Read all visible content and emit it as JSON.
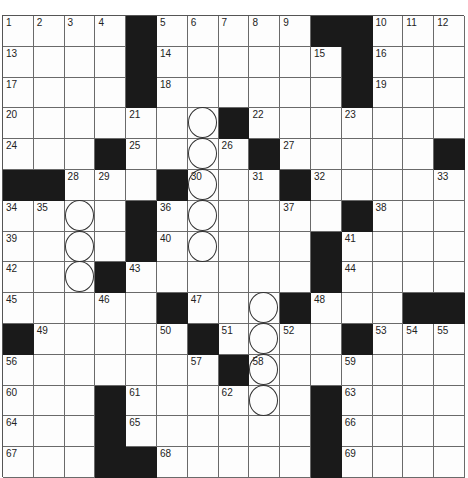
{
  "puzzle": {
    "rows": 15,
    "cols": 15,
    "layout": [
      "1111011111001 11",
      "placeholder"
    ],
    "grid": [
      [
        {
          "n": "1"
        },
        {
          "n": "2"
        },
        {
          "n": "3"
        },
        {
          "n": "4"
        },
        {
          "b": 1
        },
        {
          "n": "5"
        },
        {
          "n": "6"
        },
        {
          "n": "7"
        },
        {
          "n": "8"
        },
        {
          "n": "9"
        },
        {
          "b": 1
        },
        {
          "b": 1
        },
        {
          "n": "10"
        },
        {
          "n": "11"
        },
        {
          "n": "12"
        }
      ],
      [
        {
          "n": "13"
        },
        {},
        {},
        {},
        {
          "b": 1
        },
        {
          "n": "14"
        },
        {},
        {},
        {},
        {},
        {
          "n": "15"
        },
        {
          "b": 1
        },
        {
          "n": "16"
        },
        {},
        {}
      ],
      [
        {
          "n": "17"
        },
        {},
        {},
        {},
        {
          "b": 1
        },
        {
          "n": "18"
        },
        {},
        {},
        {},
        {},
        {},
        {
          "b": 1
        },
        {
          "n": "19"
        },
        {},
        {}
      ],
      [
        {
          "n": "20"
        },
        {},
        {},
        {},
        {
          "n": "21"
        },
        {},
        {
          "c": 1
        },
        {
          "b": 1
        },
        {
          "n": "22"
        },
        {},
        {},
        {
          "n": "23"
        },
        {},
        {},
        {}
      ],
      [
        {
          "n": "24"
        },
        {},
        {},
        {
          "b": 1
        },
        {
          "n": "25"
        },
        {},
        {
          "c": 1
        },
        {
          "n": "26"
        },
        {
          "b": 1
        },
        {
          "n": "27"
        },
        {},
        {},
        {},
        {},
        {
          "b": 1
        }
      ],
      [
        {
          "b": 1
        },
        {
          "b": 1
        },
        {
          "n": "28"
        },
        {
          "n": "29"
        },
        {},
        {
          "b": 1
        },
        {
          "n": "30",
          "c": 1
        },
        {},
        {
          "n": "31"
        },
        {
          "b": 1
        },
        {
          "n": "32"
        },
        {},
        {},
        {},
        {
          "n": "33"
        }
      ],
      [
        {
          "n": "34"
        },
        {
          "n": "35"
        },
        {
          "c": 1
        },
        {},
        {
          "b": 1
        },
        {
          "n": "36"
        },
        {
          "c": 1
        },
        {},
        {},
        {
          "n": "37"
        },
        {},
        {
          "b": 1
        },
        {
          "n": "38"
        },
        {},
        {}
      ],
      [
        {
          "n": "39"
        },
        {},
        {
          "c": 1
        },
        {},
        {
          "b": 1
        },
        {
          "n": "40"
        },
        {
          "c": 1
        },
        {},
        {},
        {},
        {
          "b": 1
        },
        {
          "n": "41"
        },
        {},
        {},
        {}
      ],
      [
        {
          "n": "42"
        },
        {},
        {
          "c": 1
        },
        {
          "b": 1
        },
        {
          "n": "43"
        },
        {},
        {},
        {},
        {},
        {},
        {
          "b": 1
        },
        {
          "n": "44"
        },
        {},
        {},
        {}
      ],
      [
        {
          "n": "45"
        },
        {},
        {},
        {
          "n": "46"
        },
        {},
        {
          "b": 1
        },
        {
          "n": "47"
        },
        {},
        {
          "c": 1
        },
        {
          "b": 1
        },
        {
          "n": "48"
        },
        {},
        {},
        {
          "b": 1
        },
        {
          "b": 1
        }
      ],
      [
        {
          "b": 1
        },
        {
          "n": "49"
        },
        {},
        {},
        {},
        {
          "n": "50"
        },
        {
          "b": 1
        },
        {
          "n": "51"
        },
        {
          "c": 1
        },
        {
          "n": "52"
        },
        {},
        {
          "b": 1
        },
        {
          "n": "53"
        },
        {
          "n": "54"
        },
        {
          "n": "55"
        }
      ],
      [
        {
          "n": "56"
        },
        {},
        {},
        {},
        {},
        {},
        {
          "n": "57"
        },
        {
          "b": 1
        },
        {
          "n": "58",
          "c": 1
        },
        {},
        {},
        {
          "n": "59"
        },
        {},
        {},
        {}
      ],
      [
        {
          "n": "60"
        },
        {},
        {},
        {
          "b": 1
        },
        {
          "n": "61"
        },
        {},
        {},
        {
          "n": "62"
        },
        {
          "c": 1
        },
        {},
        {
          "b": 1
        },
        {
          "n": "63"
        },
        {},
        {},
        {}
      ],
      [
        {
          "n": "64"
        },
        {},
        {},
        {
          "b": 1
        },
        {
          "n": "65"
        },
        {},
        {},
        {},
        {},
        {},
        {
          "b": 1
        },
        {
          "n": "66"
        },
        {},
        {},
        {}
      ],
      [
        {
          "n": "67"
        },
        {},
        {},
        {
          "b": 1
        },
        {
          "b": 1
        },
        {
          "n": "68"
        },
        {},
        {},
        {},
        {},
        {
          "b": 1
        },
        {
          "n": "69"
        },
        {},
        {},
        {}
      ]
    ]
  },
  "colors": {
    "block": "#1a1a1a",
    "cell": "#fdfdfd",
    "gridline": "#6a6a6a"
  }
}
